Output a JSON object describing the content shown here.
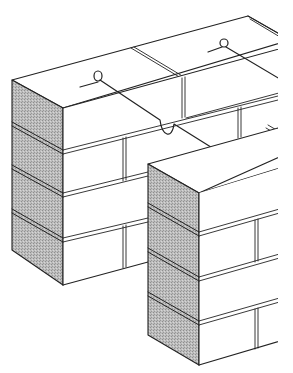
{
  "figure": {
    "colors": {
      "background": "#ffffff",
      "line": "#222222",
      "shade": "#b8b8b8",
      "shade_dark": "#a9a9a9",
      "face": "#ffffff"
    },
    "elements": [
      {
        "name": "back-wall",
        "courses_visible": 4
      },
      {
        "name": "front-pier",
        "courses_visible": 4
      },
      {
        "name": "wire-tie",
        "count": 2
      }
    ]
  }
}
